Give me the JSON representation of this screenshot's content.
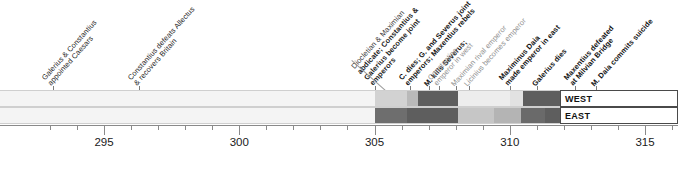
{
  "chart_data": {
    "type": "timeline",
    "title": "",
    "xlabel": "",
    "ylabel": "",
    "xlim": [
      292.4,
      316.2
    ],
    "grid": false,
    "legend_position": "right-inline",
    "axis": {
      "major_ticks": [
        295,
        300,
        305,
        310,
        315
      ],
      "major_labels": [
        "295",
        "300",
        "305",
        "310",
        "315"
      ],
      "minor_tick_step": 1,
      "minor_ticks": [
        293,
        294,
        296,
        297,
        298,
        299,
        301,
        302,
        303,
        304,
        306,
        307,
        308,
        309,
        311,
        312,
        313,
        314,
        316
      ]
    },
    "lanes": [
      {
        "name": "WEST",
        "label": "WEST"
      },
      {
        "name": "EAST",
        "label": "EAST"
      }
    ],
    "segments_west": [
      {
        "start": 292.4,
        "end": 305.0,
        "shade": "#f4f4f4"
      },
      {
        "start": 305.0,
        "end": 306.2,
        "shade": "#d2d2d2"
      },
      {
        "start": 306.2,
        "end": 306.6,
        "shade": "#b9b9b9"
      },
      {
        "start": 306.6,
        "end": 308.1,
        "shade": "#5e5e5e"
      },
      {
        "start": 308.1,
        "end": 310.0,
        "shade": "#ededed"
      },
      {
        "start": 310.0,
        "end": 310.5,
        "shade": "#e2e2e2"
      },
      {
        "start": 310.5,
        "end": 312.0,
        "shade": "#5e5e5e"
      },
      {
        "start": 312.0,
        "end": 313.0,
        "shade": "#6a6a6a"
      },
      {
        "start": 313.0,
        "end": 316.2,
        "shade": "#f4f4f4"
      }
    ],
    "segments_east": [
      {
        "start": 292.4,
        "end": 305.0,
        "shade": "#f4f4f4"
      },
      {
        "start": 305.0,
        "end": 306.2,
        "shade": "#6e6e6e"
      },
      {
        "start": 306.2,
        "end": 308.1,
        "shade": "#5e5e5e"
      },
      {
        "start": 308.1,
        "end": 309.4,
        "shade": "#c6c6c6"
      },
      {
        "start": 309.4,
        "end": 310.4,
        "shade": "#b4b4b4"
      },
      {
        "start": 310.4,
        "end": 311.3,
        "shade": "#6a6a6a"
      },
      {
        "start": 311.3,
        "end": 313.2,
        "shade": "#5e5e5e"
      },
      {
        "start": 313.2,
        "end": 316.2,
        "shade": "#f4f4f4"
      }
    ],
    "events": [
      {
        "id": "galerius-constantius-caesars",
        "year": 293.1,
        "lines": [
          "Galerius & Constantius",
          "appointed Caesars"
        ],
        "emphasis": "normal"
      },
      {
        "id": "constantius-defeats-allectus",
        "year": 296.3,
        "lines": [
          "Constantius defeats Allectus",
          "& recovers Britain"
        ],
        "emphasis": "normal"
      },
      {
        "id": "diocletian-maximian-abdicate",
        "year": 305.0,
        "lines": [
          "Diocletian & Maximian",
          "abdicate; Constantius &",
          "Galerius become joint",
          "emperors"
        ],
        "emphasis": "mixed-bold"
      },
      {
        "id": "constantius-dies",
        "year": 306.3,
        "lines": [
          "C. dies; G. and Severus joint",
          "emperors; Maxentius rebels"
        ],
        "emphasis": "bold"
      },
      {
        "id": "maxentius-kills-severus",
        "year": 307.0,
        "lines": [
          "M. kills Severus;"
        ],
        "emphasis": "bold"
      },
      {
        "id": "constantine-emperor-west",
        "year": 307.4,
        "lines": [
          "Constantine",
          "emperor in west"
        ],
        "emphasis": "grey"
      },
      {
        "id": "maximian-rival-emperor",
        "year": 308.0,
        "lines": [
          "Maximian rival emperor"
        ],
        "emphasis": "grey"
      },
      {
        "id": "licinius-becomes-emperor",
        "year": 308.5,
        "lines": [
          "Licinius becomes emperor"
        ],
        "emphasis": "grey"
      },
      {
        "id": "maximinus-daia-emperor-east",
        "year": 310.0,
        "lines": [
          "Maximinus Daia",
          "made emperor in east"
        ],
        "emphasis": "bold"
      },
      {
        "id": "galerius-dies",
        "year": 311.0,
        "lines": [
          "Galerius dies"
        ],
        "emphasis": "bold"
      },
      {
        "id": "maxentius-defeated-milvian",
        "year": 312.4,
        "lines": [
          "Maxentius defeated",
          "at Milvian Bridge"
        ],
        "emphasis": "bold"
      },
      {
        "id": "daia-commits-suicide",
        "year": 313.2,
        "lines": [
          "M. Daia commits suicide"
        ],
        "emphasis": "bold"
      }
    ]
  },
  "legend": {
    "west_label": "WEST",
    "east_label": "EAST"
  }
}
